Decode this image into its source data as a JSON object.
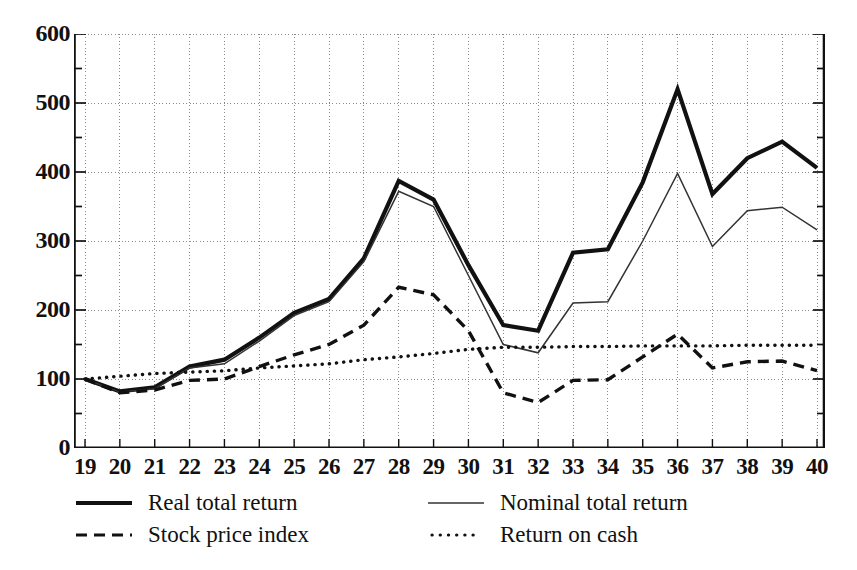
{
  "chart_data": {
    "type": "line",
    "title": "",
    "xlabel": "",
    "ylabel": "",
    "xlim": [
      19,
      40
    ],
    "ylim": [
      0,
      600
    ],
    "ytick_labels": [
      "600",
      "500",
      "400",
      "300",
      "200",
      "100",
      "0"
    ],
    "yticks": [
      600,
      500,
      400,
      300,
      200,
      100,
      0
    ],
    "yminor_step": 50,
    "grid": true,
    "grid_style": "dotted",
    "legend_position": "below",
    "x": [
      19,
      20,
      21,
      22,
      23,
      24,
      25,
      26,
      27,
      28,
      29,
      30,
      31,
      32,
      33,
      34,
      35,
      36,
      37,
      38,
      39,
      40
    ],
    "xtick_labels": [
      "19",
      "20",
      "21",
      "22",
      "23",
      "24",
      "25",
      "26",
      "27",
      "28",
      "29",
      "30",
      "31",
      "32",
      "33",
      "34",
      "35",
      "36",
      "37",
      "38",
      "39",
      "40"
    ],
    "series": [
      {
        "name": "Real total return",
        "style": "solid-thick",
        "color": "#111111",
        "values": [
          100,
          82,
          88,
          118,
          128,
          160,
          196,
          216,
          275,
          387,
          360,
          265,
          178,
          170,
          283,
          288,
          385,
          520,
          368,
          420,
          444,
          406
        ]
      },
      {
        "name": "Nominal total return",
        "style": "solid-thin",
        "color": "#333333",
        "values": [
          100,
          81,
          86,
          116,
          122,
          155,
          192,
          212,
          270,
          372,
          350,
          250,
          150,
          138,
          210,
          212,
          300,
          398,
          292,
          344,
          349,
          316
        ]
      },
      {
        "name": "Stock price index",
        "style": "dashed",
        "color": "#111111",
        "values": [
          100,
          80,
          84,
          98,
          100,
          118,
          135,
          150,
          178,
          233,
          222,
          170,
          80,
          66,
          98,
          99,
          132,
          165,
          116,
          125,
          126,
          112
        ]
      },
      {
        "name": "Return on cash",
        "style": "dotted",
        "color": "#111111",
        "values": [
          100,
          104,
          108,
          110,
          112,
          116,
          119,
          122,
          128,
          132,
          137,
          143,
          146,
          146,
          147,
          147,
          148,
          148,
          148,
          149,
          149,
          149
        ]
      }
    ]
  },
  "legend": {
    "entries": [
      {
        "label": "Real total return",
        "sample": "solid-thick-line-sample"
      },
      {
        "label": "Nominal total return",
        "sample": "solid-thin-line-sample"
      },
      {
        "label": "Stock price index",
        "sample": "dashed-line-sample"
      },
      {
        "label": "Return on cash",
        "sample": "dotted-line-sample"
      }
    ]
  },
  "colors": {
    "ink": "#111111",
    "grid": "#8a8a8a",
    "axis": "#111111",
    "background": "#ffffff"
  }
}
